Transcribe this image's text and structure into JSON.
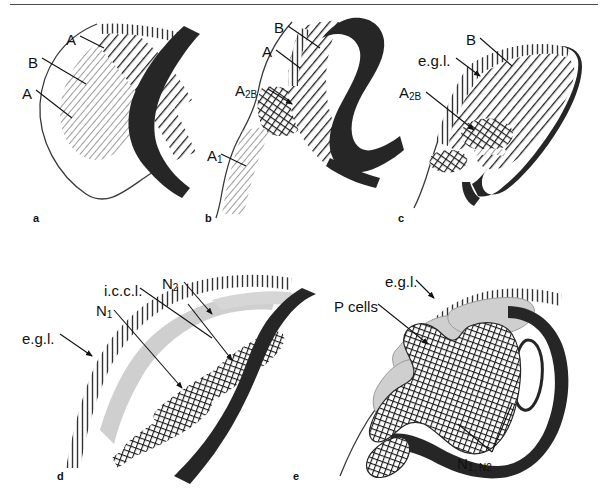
{
  "figure": {
    "kind": "line-drawing-schematic",
    "title_text": "",
    "top_rule": true,
    "background": "#ffffff",
    "ink": "#111111",
    "colors": {
      "ink_black": "#1a1a1a",
      "solid_band": "#262626",
      "hatch": "#1f1f1f",
      "light_gray_cells": "#c9c9c9",
      "outline_thin": "#3a3a3a"
    }
  },
  "panels": [
    {
      "id": "a",
      "letter": "a",
      "letter_pos": {
        "x": 33,
        "y": 212
      },
      "labels": [
        {
          "name": "label-a-top",
          "text": "A",
          "sub": "",
          "x": 66,
          "y": 32
        },
        {
          "name": "label-b",
          "text": "B",
          "sub": "",
          "x": 28,
          "y": 55
        },
        {
          "name": "label-a-bottom",
          "text": "A",
          "sub": "",
          "x": 22,
          "y": 86
        }
      ]
    },
    {
      "id": "b",
      "letter": "b",
      "letter_pos": {
        "x": 205,
        "y": 212
      },
      "labels": [
        {
          "name": "label-b-top",
          "text": "B",
          "sub": "",
          "x": 274,
          "y": 20
        },
        {
          "name": "label-a",
          "text": "A",
          "sub": "",
          "x": 262,
          "y": 44
        },
        {
          "name": "label-a2b",
          "text": "A",
          "sub": "2B",
          "x": 235,
          "y": 83
        },
        {
          "name": "label-a1",
          "text": "A",
          "sub": "1",
          "x": 207,
          "y": 148
        }
      ]
    },
    {
      "id": "c",
      "letter": "c",
      "letter_pos": {
        "x": 398,
        "y": 212
      },
      "labels": [
        {
          "name": "label-b",
          "text": "B",
          "sub": "",
          "x": 466,
          "y": 32
        },
        {
          "name": "label-egl",
          "text": "e.g.l.",
          "sub": "",
          "x": 418,
          "y": 53
        },
        {
          "name": "label-a2b",
          "text": "A",
          "sub": "2B",
          "x": 399,
          "y": 85
        }
      ]
    },
    {
      "id": "d",
      "letter": "d",
      "letter_pos": {
        "x": 57,
        "y": 470
      },
      "labels": [
        {
          "name": "label-iccl",
          "text": "i.c.c.l.",
          "sub": "",
          "x": 104,
          "y": 283
        },
        {
          "name": "label-n2",
          "text": "N",
          "sub": "2",
          "x": 162,
          "y": 276
        },
        {
          "name": "label-n1",
          "text": "N",
          "sub": "1",
          "x": 96,
          "y": 303
        },
        {
          "name": "label-egl",
          "text": "e.g.l.",
          "sub": "",
          "x": 22,
          "y": 331
        }
      ]
    },
    {
      "id": "e",
      "letter": "e",
      "letter_pos": {
        "x": 293,
        "y": 470
      },
      "labels": [
        {
          "name": "label-egl",
          "text": "e.g.l.",
          "sub": "",
          "x": 385,
          "y": 274
        },
        {
          "name": "label-pcells",
          "text": "P cells",
          "sub": "",
          "x": 334,
          "y": 299
        },
        {
          "name": "label-n1n2",
          "text": "N",
          "sub": "1, N2",
          "x": 457,
          "y": 456
        }
      ]
    }
  ],
  "legend_terms": {
    "egl": "e.g.l.",
    "iccl": "i.c.c.l.",
    "p_cells": "P cells",
    "a": "A",
    "b": "B",
    "a1": "A1",
    "a2b": "A2B",
    "n1": "N1",
    "n2": "N2",
    "n1_n2": "N1, N2"
  }
}
